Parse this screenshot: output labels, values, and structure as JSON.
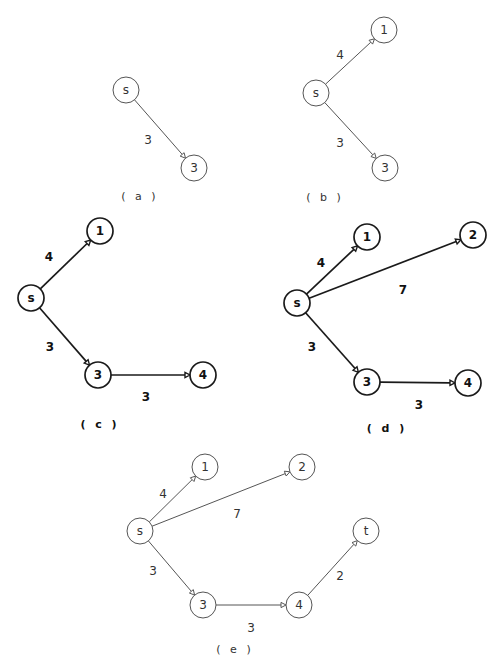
{
  "figure": {
    "node_radius": 13,
    "panels": [
      {
        "id": "a",
        "caption": "( a )",
        "caption_pos": [
          140,
          196
        ],
        "style": "thin",
        "nodes": [
          {
            "id": "s",
            "label": "s",
            "x": 126,
            "y": 90
          },
          {
            "id": "3",
            "label": "3",
            "x": 194,
            "y": 168
          }
        ],
        "edges": [
          {
            "from": "s",
            "to": "3",
            "weight": "3",
            "label_pos": [
              148,
              140
            ]
          }
        ]
      },
      {
        "id": "b",
        "caption": "( b )",
        "caption_pos": [
          325,
          197
        ],
        "style": "thin",
        "nodes": [
          {
            "id": "s",
            "label": "s",
            "x": 316,
            "y": 93
          },
          {
            "id": "1",
            "label": "1",
            "x": 384,
            "y": 30
          },
          {
            "id": "3",
            "label": "3",
            "x": 385,
            "y": 168
          }
        ],
        "edges": [
          {
            "from": "s",
            "to": "1",
            "weight": "4",
            "label_pos": [
              340,
              55
            ]
          },
          {
            "from": "s",
            "to": "3",
            "weight": "3",
            "label_pos": [
              340,
              143
            ]
          }
        ]
      },
      {
        "id": "c",
        "caption": "( c )",
        "caption_pos": [
          100,
          424
        ],
        "style": "bold",
        "nodes": [
          {
            "id": "s",
            "label": "s",
            "x": 31,
            "y": 298
          },
          {
            "id": "1",
            "label": "1",
            "x": 100,
            "y": 231
          },
          {
            "id": "3",
            "label": "3",
            "x": 98,
            "y": 375
          },
          {
            "id": "4",
            "label": "4",
            "x": 203,
            "y": 375
          }
        ],
        "edges": [
          {
            "from": "s",
            "to": "1",
            "weight": "4",
            "label_pos": [
              49,
              257
            ]
          },
          {
            "from": "s",
            "to": "3",
            "weight": "3",
            "label_pos": [
              50,
              347
            ]
          },
          {
            "from": "3",
            "to": "4",
            "weight": "3",
            "label_pos": [
              146,
              397
            ]
          }
        ]
      },
      {
        "id": "d",
        "caption": "( d )",
        "caption_pos": [
          387,
          428
        ],
        "style": "bold",
        "nodes": [
          {
            "id": "s",
            "label": "s",
            "x": 297,
            "y": 303
          },
          {
            "id": "1",
            "label": "1",
            "x": 367,
            "y": 237
          },
          {
            "id": "2",
            "label": "2",
            "x": 473,
            "y": 235
          },
          {
            "id": "3",
            "label": "3",
            "x": 367,
            "y": 382
          },
          {
            "id": "4",
            "label": "4",
            "x": 468,
            "y": 383
          }
        ],
        "edges": [
          {
            "from": "s",
            "to": "1",
            "weight": "4",
            "label_pos": [
              321,
              263
            ]
          },
          {
            "from": "s",
            "to": "2",
            "weight": "7",
            "label_pos": [
              403,
              290
            ]
          },
          {
            "from": "s",
            "to": "3",
            "weight": "3",
            "label_pos": [
              312,
              347
            ]
          },
          {
            "from": "3",
            "to": "4",
            "weight": "3",
            "label_pos": [
              419,
              405
            ]
          }
        ]
      },
      {
        "id": "e",
        "caption": "( e )",
        "caption_pos": [
          235,
          649
        ],
        "style": "thin",
        "nodes": [
          {
            "id": "s",
            "label": "s",
            "x": 140,
            "y": 531
          },
          {
            "id": "1",
            "label": "1",
            "x": 205,
            "y": 467
          },
          {
            "id": "2",
            "label": "2",
            "x": 302,
            "y": 467
          },
          {
            "id": "3",
            "label": "3",
            "x": 203,
            "y": 605
          },
          {
            "id": "4",
            "label": "4",
            "x": 299,
            "y": 605
          },
          {
            "id": "t",
            "label": "t",
            "x": 366,
            "y": 531
          }
        ],
        "edges": [
          {
            "from": "s",
            "to": "1",
            "weight": "4",
            "label_pos": [
              163,
              494
            ]
          },
          {
            "from": "s",
            "to": "2",
            "weight": "7",
            "label_pos": [
              237,
              514
            ]
          },
          {
            "from": "s",
            "to": "3",
            "weight": "3",
            "label_pos": [
              153,
              571
            ]
          },
          {
            "from": "3",
            "to": "4",
            "weight": "3",
            "label_pos": [
              251,
              628
            ]
          },
          {
            "from": "4",
            "to": "t",
            "weight": "2",
            "label_pos": [
              340,
              576
            ]
          }
        ]
      }
    ]
  }
}
